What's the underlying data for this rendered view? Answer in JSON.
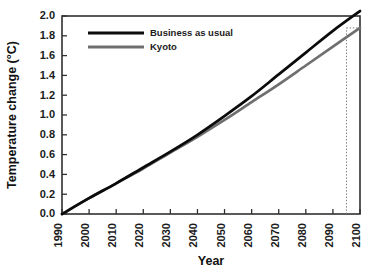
{
  "chart_data": {
    "type": "line",
    "title": "",
    "xlabel": "Year",
    "ylabel": "Temperature change (°C)",
    "xlim": [
      1990,
      2100
    ],
    "ylim": [
      0.0,
      2.0
    ],
    "grid": false,
    "legend_position": "top-left-inside",
    "x": [
      1990,
      2000,
      2010,
      2020,
      2030,
      2040,
      2050,
      2060,
      2070,
      2080,
      2090,
      2100
    ],
    "xticklabels": [
      "1990",
      "2000",
      "2010",
      "2020",
      "2030",
      "2040",
      "2050",
      "2060",
      "2070",
      "2080",
      "2090",
      "2100"
    ],
    "yticks": [
      0.0,
      0.2,
      0.4,
      0.6,
      0.8,
      1.0,
      1.2,
      1.4,
      1.6,
      1.8,
      2.0
    ],
    "yticklabels": [
      "0.0",
      "0.2",
      "0.4",
      "0.6",
      "0.8",
      "1.0",
      "1.2",
      "1.4",
      "1.6",
      "1.8",
      "2.0"
    ],
    "series": [
      {
        "name": "Business as usual",
        "color": "#0b0b0b",
        "values": [
          0.0,
          0.16,
          0.31,
          0.47,
          0.63,
          0.8,
          0.99,
          1.19,
          1.41,
          1.63,
          1.85,
          2.05
        ]
      },
      {
        "name": "Kyoto",
        "color": "#6f6f6f",
        "values": [
          0.0,
          0.16,
          0.31,
          0.46,
          0.62,
          0.78,
          0.95,
          1.13,
          1.31,
          1.5,
          1.69,
          1.88
        ]
      }
    ],
    "annotations": [
      {
        "name": "kyoto-2100-reference",
        "type": "dotted-crosshair",
        "x": 2095,
        "y": 1.88,
        "note": "dotted vertical line from x-axis up to the Kyoto curve with short horizontal dotted tie to the right frame"
      }
    ]
  },
  "legend": {
    "items": [
      {
        "label": "Business as usual",
        "color": "#0b0b0b"
      },
      {
        "label": "Kyoto",
        "color": "#6f6f6f"
      }
    ]
  },
  "axes": {
    "x_title": "Year",
    "y_title": "Temperature change (°C)"
  },
  "colors": {
    "business_as_usual": "#0b0b0b",
    "kyoto": "#6f6f6f",
    "frame": "#303030",
    "background": "#ffffff",
    "guide": "#7b7b7b"
  }
}
